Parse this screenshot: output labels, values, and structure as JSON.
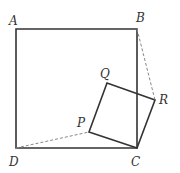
{
  "diagram": {
    "colors": {
      "stroke": "#333333",
      "dashed": "#888888",
      "background": "#ffffff"
    },
    "points": {
      "A": {
        "x": 16,
        "y": 29
      },
      "B": {
        "x": 137,
        "y": 29
      },
      "C": {
        "x": 137,
        "y": 148
      },
      "D": {
        "x": 16,
        "y": 148
      },
      "P": {
        "x": 89,
        "y": 132
      },
      "Q": {
        "x": 107,
        "y": 83
      },
      "R": {
        "x": 155,
        "y": 100
      }
    },
    "labels": {
      "A": {
        "text": "A",
        "x": 9,
        "y": 25
      },
      "B": {
        "text": "B",
        "x": 136,
        "y": 22
      },
      "C": {
        "text": "C",
        "x": 131,
        "y": 166
      },
      "D": {
        "text": "D",
        "x": 9,
        "y": 166
      },
      "P": {
        "text": "P",
        "x": 77,
        "y": 127
      },
      "Q": {
        "text": "Q",
        "x": 100,
        "y": 78
      },
      "R": {
        "text": "R",
        "x": 159,
        "y": 104
      }
    },
    "segments": {
      "solid": [
        [
          "A",
          "B"
        ],
        [
          "B",
          "C"
        ],
        [
          "C",
          "D"
        ],
        [
          "D",
          "A"
        ],
        [
          "P",
          "Q"
        ],
        [
          "Q",
          "R"
        ],
        [
          "R",
          "C"
        ],
        [
          "C",
          "P"
        ]
      ],
      "dashed": [
        [
          "D",
          "P"
        ],
        [
          "B",
          "R"
        ]
      ]
    }
  }
}
